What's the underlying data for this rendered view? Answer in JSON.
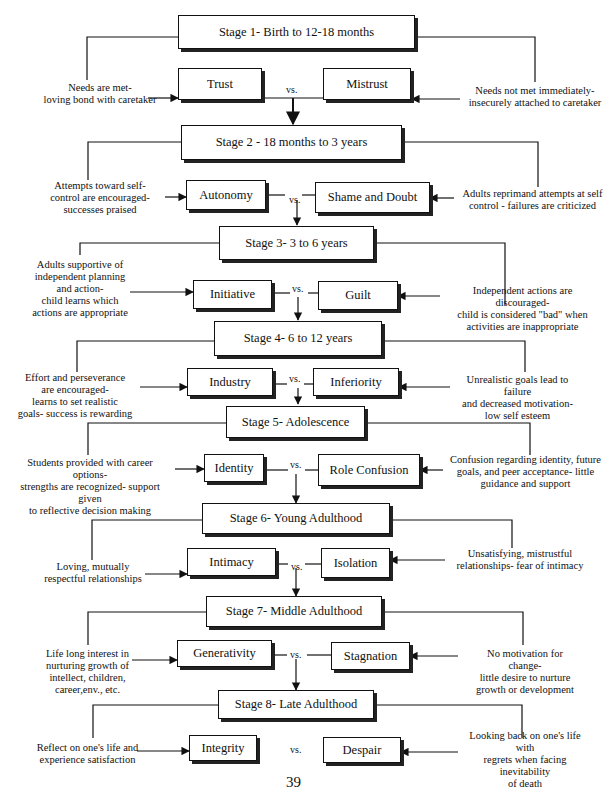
{
  "vs_label": "vs.",
  "page_number": "39",
  "stages": [
    {
      "stage": "Stage 1- Birth to 12-18 months",
      "positive": "Trust",
      "negative": "Mistrust",
      "positive_note": [
        "Needs are met-",
        "loving bond with caretaker"
      ],
      "negative_note": [
        "Needs not met immediately-",
        "insecurely attached  to caretaker"
      ]
    },
    {
      "stage": "Stage 2  - 18 months to 3 years",
      "positive": "Autonomy",
      "negative": "Shame and Doubt",
      "positive_note": [
        "Attempts toward self-",
        "control are encouraged-",
        "successes praised"
      ],
      "negative_note": [
        "Adults  reprimand attempts at self",
        "control - failures are criticized"
      ]
    },
    {
      "stage": "Stage 3-  3 to 6 years",
      "positive": "Initiative",
      "negative": "Guilt",
      "positive_note": [
        "Adults supportive of",
        "independent planning",
        "and action-",
        "child learns which",
        "actions are appropriate"
      ],
      "negative_note": [
        "Independent actions are",
        "discouraged-",
        "child is considered \"bad\" when",
        "activities are inappropriate"
      ]
    },
    {
      "stage": "Stage 4-  6 to 12 years",
      "positive": "Industry",
      "negative": "Inferiority",
      "positive_note": [
        "Effort and perseverance",
        "are encouraged-",
        "learns to set realistic",
        "goals- success is rewarding"
      ],
      "negative_note": [
        "Unrealistic goals lead to",
        "failure",
        "and decreased motivation-",
        "low self esteem"
      ]
    },
    {
      "stage": "Stage 5- Adolescence",
      "positive": "Identity",
      "negative": "Role Confusion",
      "positive_note": [
        "Students provided with career",
        "options-",
        "strengths are recognized- support",
        "given",
        "to  reflective decision making"
      ],
      "negative_note": [
        "Confusion regarding identity, future",
        "goals, and peer acceptance- little",
        "guidance and support"
      ]
    },
    {
      "stage": "Stage 6- Young Adulthood",
      "positive": "Intimacy",
      "negative": "Isolation",
      "positive_note": [
        "Loving, mutually",
        "respectful relationships"
      ],
      "negative_note": [
        "Unsatisfying,  mistrustful",
        "relationships- fear of intimacy"
      ]
    },
    {
      "stage": "Stage 7-  Middle Adulthood",
      "positive": "Generativity",
      "negative": "Stagnation",
      "positive_note": [
        "Life long interest in",
        "nurturing growth of",
        "intellect, children,",
        "career,env., etc."
      ],
      "negative_note": [
        "No motivation  for",
        "change-",
        "little desire to nurture",
        "growth or development"
      ]
    },
    {
      "stage": "Stage 8- Late Adulthood",
      "positive": "Integrity",
      "negative": "Despair",
      "positive_note": [
        "Reflect on  one's life and",
        "experience satisfaction"
      ],
      "negative_note": [
        "Looking back on one's life",
        "with",
        "regrets when  facing",
        "inevitability",
        "of death"
      ]
    }
  ]
}
